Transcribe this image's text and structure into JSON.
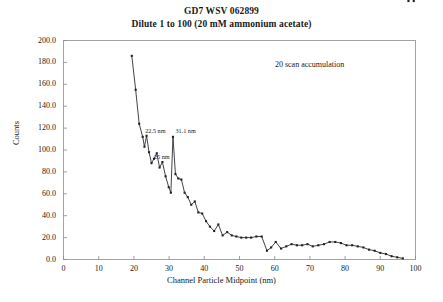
{
  "chart_data": {
    "type": "line",
    "title": "GD7 WSV 062899",
    "subtitle": "Dilute 1 to 100 (20 mM ammonium acetate)",
    "xlabel": "Channel Particle Midpoint (nm)",
    "ylabel": "Counts",
    "xlim": [
      0,
      100
    ],
    "ylim": [
      0,
      200
    ],
    "xticks": [
      "0",
      "10",
      "20",
      "30",
      "40",
      "50",
      "60",
      "70",
      "80",
      "90",
      "100"
    ],
    "yticks": [
      "0.0",
      "20.0",
      "40.0",
      "60.0",
      "80.0",
      "100.0",
      "120.0",
      "140.0",
      "160.0",
      "180.0",
      "200.0"
    ],
    "grid": false,
    "legend": null,
    "marker": "square",
    "line_color": "#222222",
    "x": [
      19.4,
      20.5,
      21.5,
      22.5,
      23.0,
      23.6,
      24.3,
      25.0,
      25.7,
      26.5,
      27.3,
      28.1,
      29.0,
      29.9,
      30.5,
      31.1,
      31.8,
      32.6,
      33.5,
      34.4,
      35.3,
      36.3,
      37.3,
      38.3,
      39.4,
      40.5,
      41.6,
      42.8,
      44.0,
      45.2,
      46.5,
      47.8,
      49.1,
      50.5,
      51.9,
      53.3,
      54.8,
      56.3,
      57.8,
      59.0,
      60.3,
      61.8,
      63.3,
      64.8,
      66.3,
      67.8,
      69.3,
      70.8,
      72.4,
      74.0,
      75.6,
      77.2,
      78.8,
      80.4,
      82.0,
      83.6,
      85.2,
      86.8,
      88.4,
      90.0,
      91.6,
      93.2,
      94.8,
      96.4,
      98.0,
      99.5
    ],
    "y": [
      186.0,
      155.0,
      124.0,
      112.0,
      103.0,
      113.0,
      98.0,
      88.0,
      92.0,
      97.0,
      84.0,
      89.0,
      76.0,
      66.0,
      61.0,
      112.0,
      78.0,
      74.0,
      73.0,
      61.0,
      57.0,
      50.0,
      53.0,
      43.0,
      42.0,
      35.0,
      30.0,
      26.0,
      32.0,
      22.0,
      25.0,
      22.0,
      21.0,
      20.0,
      20.0,
      20.0,
      21.0,
      21.0,
      8.0,
      11.0,
      16.0,
      10.0,
      12.0,
      14.0,
      13.0,
      13.0,
      14.0,
      12.0,
      13.0,
      14.0,
      16.0,
      16.0,
      15.0,
      13.0,
      13.0,
      12.0,
      11.0,
      9.0,
      8.0,
      6.0,
      5.0,
      3.0,
      2.0,
      1.0
    ],
    "annotations": [
      {
        "text": "22.5 nm",
        "x": 22.5,
        "y": 112.0
      },
      {
        "text": "25 nm",
        "x": 25.0,
        "y": 88.0
      },
      {
        "text": "31.1 nm",
        "x": 31.1,
        "y": 112.0
      },
      {
        "text": "20 scan accumulation",
        "x": 72.0,
        "y": 178.0
      }
    ]
  }
}
